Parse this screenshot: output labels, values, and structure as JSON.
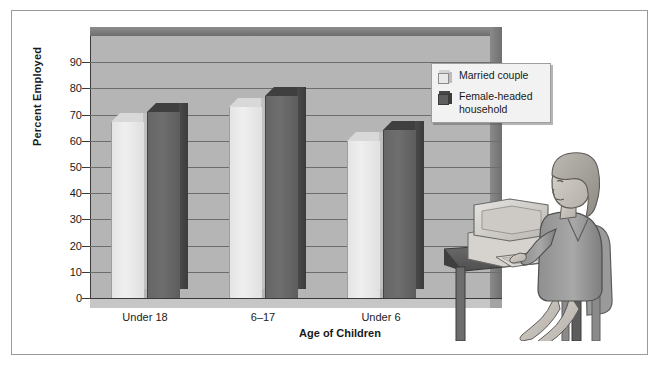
{
  "figure": {
    "background_color": "#ffffff",
    "frame_color": "#9a9a9a"
  },
  "chart_data": {
    "type": "bar",
    "title": "",
    "subtitle": "",
    "categories": [
      "Under 18",
      "6–17",
      "Under 6"
    ],
    "series": [
      {
        "name": "Married couple",
        "values": [
          67,
          73,
          60
        ],
        "color": "#e8e8e8"
      },
      {
        "name": "Female-headed household",
        "values": [
          71,
          77,
          64
        ],
        "color": "#5e5e5e"
      }
    ],
    "xlabel": "Age of Children",
    "ylabel": "Percent Employed",
    "ylim": [
      0,
      100
    ],
    "ytick_values": [
      0,
      10,
      20,
      30,
      40,
      50,
      60,
      70,
      80,
      90
    ],
    "ytick_labels": [
      "0",
      "10",
      "20",
      "30",
      "40",
      "50",
      "60",
      "70",
      "80",
      "90"
    ],
    "grid": true,
    "legend_position": "top-right",
    "style": "3d-bar",
    "annotations": []
  },
  "legend": {
    "entries": [
      {
        "label": "Married couple",
        "swatch": "light-cube-icon"
      },
      {
        "label": "Female-headed household",
        "swatch": "dark-cube-icon"
      }
    ]
  },
  "illustration": {
    "name": "woman-at-computer-illustration",
    "description": "Woman seated at desk typing on a computer keyboard with monitor"
  }
}
